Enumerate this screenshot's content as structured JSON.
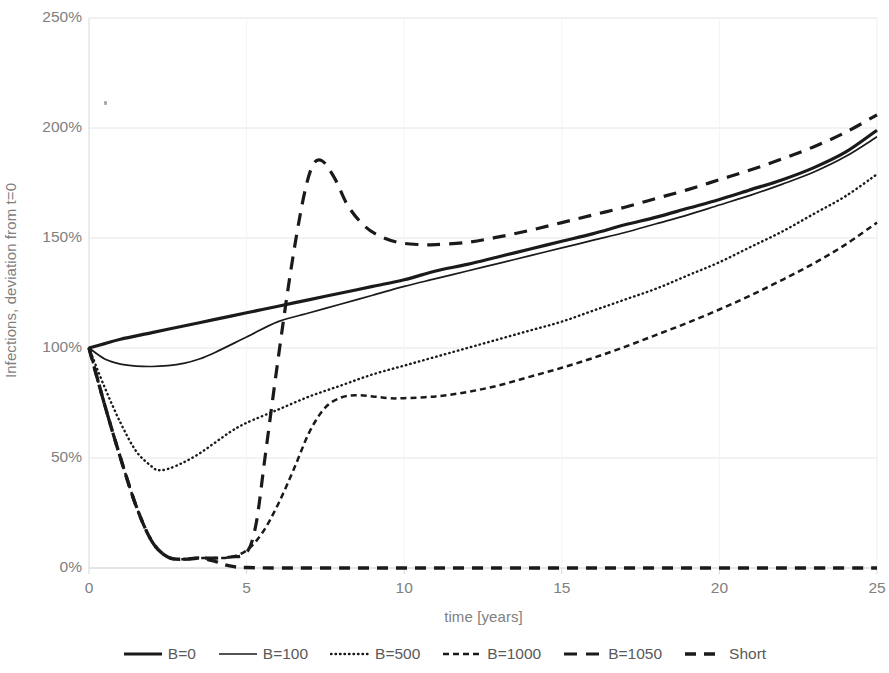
{
  "chart_data": {
    "type": "line",
    "title": "",
    "xlabel": "time [years]",
    "ylabel": "Infections, deviation from t=0",
    "xlim": [
      0,
      25
    ],
    "ylim": [
      0,
      250
    ],
    "xticks": [
      0,
      5,
      10,
      15,
      20,
      25
    ],
    "xtick_labels": [
      "0",
      "5",
      "10",
      "15",
      "20",
      "25"
    ],
    "yticks": [
      0,
      50,
      100,
      150,
      200,
      250
    ],
    "ytick_labels": [
      "0%",
      "50%",
      "100%",
      "150%",
      "200%",
      "250%"
    ],
    "grid": true,
    "grid_axis": "y",
    "legend_position": "bottom",
    "line_color": "#1a1a1a",
    "grid_color": "#e6e6e6",
    "axis_color": "#d9d9d9",
    "series": [
      {
        "name": "B=0",
        "style": "solid-thick",
        "width": 3.2,
        "dasharray": "",
        "x": [
          0,
          0.5,
          1,
          2,
          3,
          4,
          5,
          6,
          7,
          8,
          9,
          10,
          11,
          12,
          13,
          14,
          15,
          16,
          17,
          18,
          19,
          20,
          21,
          22,
          23,
          24,
          25
        ],
        "y": [
          100,
          102,
          104,
          107,
          110,
          113,
          116,
          119,
          122,
          125,
          128,
          131,
          135,
          138,
          141.5,
          145,
          148.5,
          152,
          156,
          159.5,
          163.5,
          167.5,
          172,
          176.5,
          182,
          189,
          199
        ]
      },
      {
        "name": "B=100",
        "style": "solid-thin",
        "width": 1.7,
        "dasharray": "",
        "x": [
          0,
          0.5,
          1,
          1.5,
          2,
          2.5,
          3,
          3.5,
          4,
          5,
          6,
          7,
          8,
          9,
          10,
          11,
          12,
          13,
          14,
          15,
          16,
          17,
          18,
          19,
          20,
          21,
          22,
          23,
          24,
          25
        ],
        "y": [
          100,
          95,
          92.7,
          91.8,
          91.6,
          92,
          93,
          95,
          98,
          105,
          112,
          116,
          120,
          124,
          128,
          131.5,
          135,
          138.5,
          142,
          145.5,
          149,
          152.5,
          156.5,
          160.5,
          165,
          169.5,
          174.5,
          180,
          187,
          196
        ]
      },
      {
        "name": "B=500",
        "style": "dotted",
        "width": 2.4,
        "dasharray": "0.5 4",
        "x": [
          0,
          0.5,
          1,
          1.5,
          2,
          2.2,
          2.5,
          3,
          3.5,
          4,
          4.5,
          5,
          6,
          7,
          8,
          9,
          10,
          11,
          12,
          13,
          14,
          15,
          16,
          17,
          18,
          19,
          20,
          21,
          22,
          23,
          24,
          25
        ],
        "y": [
          100,
          82,
          66,
          53,
          46,
          44.5,
          45,
          48,
          52,
          57,
          62,
          66,
          72,
          78,
          83,
          88,
          92,
          96,
          100,
          104,
          108,
          112,
          117,
          122,
          127,
          133,
          139,
          146,
          153,
          161,
          169,
          179
        ]
      },
      {
        "name": "B=1000",
        "style": "dashed-small",
        "width": 2.5,
        "dasharray": "6 4",
        "x": [
          0,
          0.5,
          1,
          1.5,
          2,
          2.5,
          3,
          3.5,
          4,
          4.5,
          5,
          5.5,
          6,
          6.5,
          7,
          7.5,
          8,
          8.5,
          9,
          9.5,
          10,
          11,
          12,
          13,
          14,
          15,
          16,
          17,
          18,
          19,
          20,
          21,
          22,
          23,
          24,
          25
        ],
        "y": [
          100,
          74,
          50,
          28,
          12,
          5,
          4,
          4.5,
          4.5,
          5,
          8,
          16,
          29,
          45,
          62,
          73,
          77.5,
          78.5,
          78,
          77.2,
          77.2,
          78,
          80,
          83,
          87,
          91,
          95.5,
          100.5,
          106,
          111.5,
          117.5,
          124,
          131,
          138.5,
          147,
          157
        ]
      },
      {
        "name": "B=1050",
        "style": "dashed-long",
        "width": 3.2,
        "dasharray": "13 9",
        "x": [
          0,
          0.5,
          1,
          1.5,
          2,
          2.5,
          3,
          3.5,
          4,
          4.5,
          5,
          5.3,
          5.6,
          6,
          6.4,
          6.8,
          7.1,
          7.4,
          7.8,
          8.2,
          8.7,
          9.2,
          9.8,
          10.5,
          11,
          12,
          13,
          14,
          15,
          16,
          17,
          18,
          19,
          20,
          21,
          22,
          23,
          24,
          25
        ],
        "y": [
          100,
          74,
          50,
          28,
          12,
          5,
          4,
          4.5,
          4.5,
          5,
          7,
          20,
          52,
          95,
          135,
          168,
          183,
          185,
          177,
          165,
          156,
          151,
          148,
          147,
          147,
          148,
          150.5,
          153.5,
          157,
          160.5,
          164,
          168,
          172,
          176.5,
          181,
          186,
          191.5,
          198,
          206
        ]
      },
      {
        "name": "Short",
        "style": "dashed-thick",
        "width": 3.4,
        "dasharray": "11 8",
        "x": [
          0,
          0.5,
          1,
          1.5,
          2,
          2.5,
          3,
          3.5,
          4,
          4.3,
          4.6,
          5,
          6,
          8,
          10,
          12,
          14,
          16,
          18,
          20,
          22,
          24,
          25
        ],
        "y": [
          100,
          74,
          50,
          28,
          12,
          5,
          4,
          4.5,
          3,
          1.5,
          0.6,
          0.2,
          0,
          0,
          0,
          0,
          0,
          0,
          0,
          0,
          0,
          0,
          0
        ]
      }
    ]
  },
  "legend": {
    "items": [
      {
        "label": "B=0",
        "style": "solid-thick"
      },
      {
        "label": "B=100",
        "style": "solid-thin"
      },
      {
        "label": "B=500",
        "style": "dotted"
      },
      {
        "label": "B=1000",
        "style": "dashed-small"
      },
      {
        "label": "B=1050",
        "style": "dashed-long"
      },
      {
        "label": "Short",
        "style": "dashed-thick"
      }
    ]
  }
}
